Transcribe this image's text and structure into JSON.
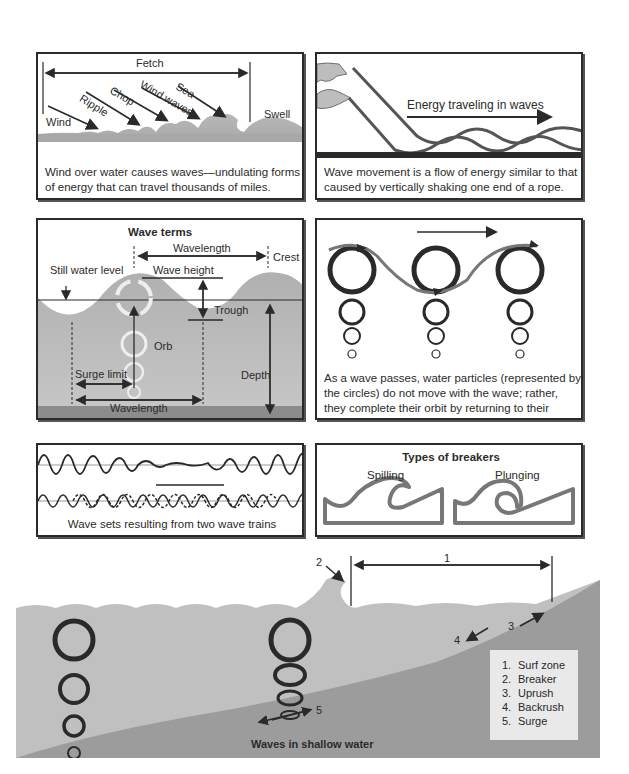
{
  "panels": {
    "wind": {
      "fetch_label": "Fetch",
      "labels": [
        "Wind",
        "Ripple",
        "Chop",
        "Wind waves",
        "Sea",
        "Swell"
      ],
      "caption": "Wind over water causes waves—undulating forms of energy that can travel thousands of miles."
    },
    "rope": {
      "arrow_label": "Energy traveling in waves",
      "caption": "Wave movement is a flow of energy similar to that caused by vertically shaking one end of a rope."
    },
    "terms": {
      "title": "Wave terms",
      "labels": {
        "wavelength_top": "Wavelength",
        "crest": "Crest",
        "still_water_level": "Still water level",
        "wave_height": "Wave height",
        "trough": "Trough",
        "orb": "Orb",
        "surge_limit": "Surge limit",
        "depth": "Depth",
        "wavelength_bottom": "Wavelength"
      }
    },
    "orbits": {
      "caption": "As a wave passes, water particles (represented by the circles) do not move with the wave; rather, they complete their orbit by returning to their starting point."
    },
    "wave_sets": {
      "caption": "Wave sets resulting from two wave trains"
    },
    "breakers": {
      "title": "Types of breakers",
      "types": [
        "Spilling",
        "Plunging"
      ]
    },
    "shallow": {
      "title": "Waves in shallow water",
      "markers": [
        "1",
        "2",
        "3",
        "4",
        "5"
      ],
      "legend": [
        {
          "num": "1.",
          "label": "Surf zone"
        },
        {
          "num": "2.",
          "label": "Breaker"
        },
        {
          "num": "3.",
          "label": "Uprush"
        },
        {
          "num": "4.",
          "label": "Backrush"
        },
        {
          "num": "5.",
          "label": "Surge"
        }
      ]
    }
  },
  "colors": {
    "water": "#b5b5b5",
    "water_deep": "#9a9a9a",
    "seabed": "#8c8c8c",
    "ink": "#2a2a2a",
    "legend_bg": "#e9e9e9"
  }
}
